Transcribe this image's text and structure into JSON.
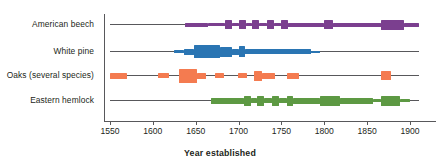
{
  "chart_data": {
    "type": "bar",
    "title": "",
    "xlabel": "Year established",
    "ylabel": "",
    "xlim": [
      1550,
      1910
    ],
    "xticks": [
      1550,
      1600,
      1650,
      1700,
      1750,
      1800,
      1850,
      1900
    ],
    "xtick_labels": [
      "1550",
      "1600",
      "1650",
      "1700",
      "1750",
      "1800",
      "1850",
      "1900"
    ],
    "grid": false,
    "legend": "none",
    "categories": [
      "American beech",
      "White pine",
      "Oaks (several species)",
      "Eastern hemlock"
    ],
    "series": [
      {
        "name": "American beech",
        "color": "#7b3f8f",
        "range": [
          1550,
          1910
        ],
        "segments": [
          {
            "start": 1637,
            "end": 1664,
            "weight": 4
          },
          {
            "start": 1664,
            "end": 1684,
            "weight": 3
          },
          {
            "start": 1684,
            "end": 1692,
            "weight": 9
          },
          {
            "start": 1692,
            "end": 1701,
            "weight": 3
          },
          {
            "start": 1701,
            "end": 1709,
            "weight": 9
          },
          {
            "start": 1709,
            "end": 1716,
            "weight": 3
          },
          {
            "start": 1716,
            "end": 1724,
            "weight": 9
          },
          {
            "start": 1724,
            "end": 1733,
            "weight": 3
          },
          {
            "start": 1733,
            "end": 1741,
            "weight": 9
          },
          {
            "start": 1741,
            "end": 1750,
            "weight": 3
          },
          {
            "start": 1750,
            "end": 1758,
            "weight": 9
          },
          {
            "start": 1758,
            "end": 1800,
            "weight": 4
          },
          {
            "start": 1800,
            "end": 1810,
            "weight": 9
          },
          {
            "start": 1810,
            "end": 1866,
            "weight": 4
          },
          {
            "start": 1866,
            "end": 1893,
            "weight": 10
          },
          {
            "start": 1893,
            "end": 1910,
            "weight": 4
          }
        ]
      },
      {
        "name": "White pine",
        "color": "#2a75b3",
        "range": [
          1550,
          1910
        ],
        "segments": [
          {
            "start": 1625,
            "end": 1636,
            "weight": 3
          },
          {
            "start": 1636,
            "end": 1648,
            "weight": 6
          },
          {
            "start": 1648,
            "end": 1678,
            "weight": 13
          },
          {
            "start": 1678,
            "end": 1692,
            "weight": 10
          },
          {
            "start": 1692,
            "end": 1700,
            "weight": 6
          },
          {
            "start": 1700,
            "end": 1708,
            "weight": 11
          },
          {
            "start": 1708,
            "end": 1785,
            "weight": 5
          },
          {
            "start": 1785,
            "end": 1795,
            "weight": 2
          }
        ]
      },
      {
        "name": "Oaks (several species)",
        "color": "#f47b50",
        "range": [
          1550,
          1910
        ],
        "segments": [
          {
            "start": 1550,
            "end": 1570,
            "weight": 6
          },
          {
            "start": 1606,
            "end": 1619,
            "weight": 5
          },
          {
            "start": 1630,
            "end": 1652,
            "weight": 14
          },
          {
            "start": 1652,
            "end": 1662,
            "weight": 6
          },
          {
            "start": 1672,
            "end": 1683,
            "weight": 5
          },
          {
            "start": 1699,
            "end": 1710,
            "weight": 5
          },
          {
            "start": 1718,
            "end": 1727,
            "weight": 10
          },
          {
            "start": 1727,
            "end": 1742,
            "weight": 6
          },
          {
            "start": 1756,
            "end": 1770,
            "weight": 6
          },
          {
            "start": 1866,
            "end": 1878,
            "weight": 9
          }
        ]
      },
      {
        "name": "Eastern hemlock",
        "color": "#5d9943",
        "range": [
          1550,
          1910
        ],
        "segments": [
          {
            "start": 1668,
            "end": 1706,
            "weight": 6
          },
          {
            "start": 1706,
            "end": 1714,
            "weight": 10
          },
          {
            "start": 1714,
            "end": 1722,
            "weight": 5
          },
          {
            "start": 1722,
            "end": 1730,
            "weight": 10
          },
          {
            "start": 1730,
            "end": 1739,
            "weight": 5
          },
          {
            "start": 1739,
            "end": 1747,
            "weight": 10
          },
          {
            "start": 1747,
            "end": 1756,
            "weight": 5
          },
          {
            "start": 1756,
            "end": 1764,
            "weight": 10
          },
          {
            "start": 1764,
            "end": 1795,
            "weight": 6
          },
          {
            "start": 1795,
            "end": 1818,
            "weight": 10
          },
          {
            "start": 1818,
            "end": 1857,
            "weight": 6
          },
          {
            "start": 1857,
            "end": 1866,
            "weight": 3
          },
          {
            "start": 1866,
            "end": 1888,
            "weight": 10
          },
          {
            "start": 1888,
            "end": 1900,
            "weight": 3
          }
        ]
      }
    ]
  },
  "axis": {
    "title": "Year established"
  }
}
